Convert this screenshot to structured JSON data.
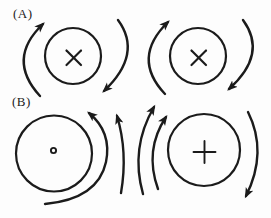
{
  "colors": {
    "ink": "#1b1b1b",
    "background": "#fdfdfd"
  },
  "panels": [
    {
      "label": "(A)",
      "figures": [
        {
          "wire_symbol": "x-cross-icon",
          "symbol_glyph": "×",
          "arrows": "left arc pointing up, right arc pointing down (clockwise circulation)"
        },
        {
          "wire_symbol": "x-cross-icon",
          "symbol_glyph": "×",
          "arrows": "left arc pointing up, right arc pointing down (clockwise circulation)"
        }
      ]
    },
    {
      "label": "(B)",
      "figures": [
        {
          "wire_symbol": "dot-ring-icon",
          "symbol_glyph": "∘",
          "arrows": "two arcs on right side pointing up (counterclockwise circulation)"
        },
        {
          "wire_symbol": "plus-icon",
          "symbol_glyph": "+",
          "arrows": "two arcs on left side pointing up, right arc pointing down (clockwise circulation)"
        }
      ]
    }
  ]
}
